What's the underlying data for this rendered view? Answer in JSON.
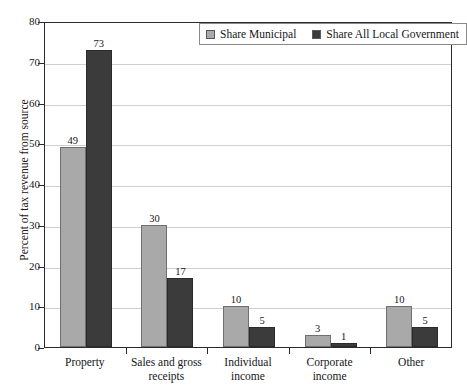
{
  "chart_data": {
    "type": "bar",
    "title": "",
    "subtitle": "",
    "xlabel": "",
    "ylabel": "Percent of tax revenue from source",
    "ylim": [
      0,
      80
    ],
    "yticks": [
      0,
      10,
      20,
      30,
      40,
      50,
      60,
      70,
      80
    ],
    "ytick_labels": [
      "0",
      "10",
      "20",
      "30",
      "40",
      "50",
      "60",
      "70",
      "80"
    ],
    "grid": true,
    "legend_position": "top-center",
    "categories": [
      "Property",
      "Sales and gross receipts",
      "Individual income",
      "Corporate income",
      "Other"
    ],
    "category_lines": [
      [
        "Property"
      ],
      [
        "Sales and gross",
        "receipts"
      ],
      [
        "Individual",
        "income"
      ],
      [
        "Corporate",
        "income"
      ],
      [
        "Other"
      ]
    ],
    "series": [
      {
        "name": "Share Municipal",
        "color": "#a9a9a9",
        "values": [
          49,
          30,
          10,
          3,
          10
        ],
        "labels": [
          "49",
          "30",
          "10",
          "3",
          "10"
        ]
      },
      {
        "name": "Share All Local Government",
        "color": "#3b3b3b",
        "values": [
          73,
          17,
          5,
          1,
          5
        ],
        "labels": [
          "73",
          "17",
          "5",
          "1",
          "5"
        ]
      }
    ]
  },
  "legend": {
    "entries": [
      {
        "label": "Share Municipal",
        "swatch": "light"
      },
      {
        "label": "Share All Local Government",
        "swatch": "dark"
      }
    ]
  }
}
